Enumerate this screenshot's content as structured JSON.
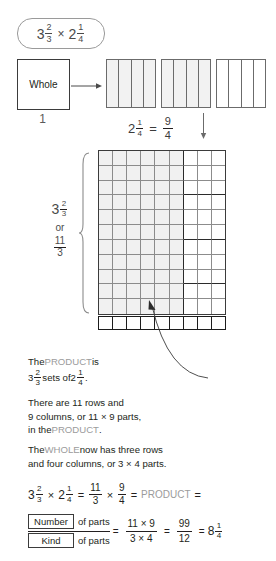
{
  "title_pill": {
    "expression": "3 2/3 x 2 1/4",
    "whole_a": "3",
    "num_a": "2",
    "den_a": "3",
    "times": "×",
    "whole_b": "2",
    "num_b": "1",
    "den_b": "4"
  },
  "whole_box": {
    "label": "Whole",
    "caption": "1"
  },
  "strip_caption": {
    "whole": "2",
    "num": "1",
    "den": "4",
    "equals": "=",
    "result_num": "9",
    "result_den": "4"
  },
  "strips": {
    "count": 3,
    "cells_per_strip": 4
  },
  "left_label": {
    "whole": "3",
    "num": "2",
    "den": "3",
    "or": "or",
    "improper_num": "11",
    "improper_den": "3"
  },
  "grid": {
    "rows": 11,
    "cols": 9,
    "shaded_cols": 6,
    "white_cols": 3,
    "thick_row_breaks": [
      3,
      6,
      9
    ],
    "bottom_strip_cells": 9
  },
  "text_product": {
    "line1_a": "The ",
    "line1_kw": "PRODUCT",
    "line1_b": " is",
    "line2_whole": "3",
    "line2_num": "2",
    "line2_den": "3",
    "line2_mid": " sets of ",
    "line2_whole2": "2",
    "line2_num2": "1",
    "line2_den2": "4",
    "line2_end": "."
  },
  "text_rows": {
    "line1": "There are 11 rows and",
    "line2": "9 columns, or 11 × 9 parts,",
    "line3_a": "in the ",
    "line3_kw": "PRODUCT",
    "line3_b": "."
  },
  "text_whole": {
    "line1_a": "The ",
    "line1_kw": "WHOLE",
    "line1_b": " now has three rows",
    "line2": "and four columns, or 3 × 4 parts."
  },
  "equation": {
    "whole_a": "3",
    "num_a": "2",
    "den_a": "3",
    "times1": "×",
    "whole_b": "2",
    "num_b": "1",
    "den_b": "4",
    "eq1": "=",
    "f1_num": "11",
    "f1_den": "3",
    "times2": "×",
    "f2_num": "9",
    "f2_den": "4",
    "eq2": "=",
    "product_kw": "PRODUCT",
    "eq3": "="
  },
  "final": {
    "number_box": "Number",
    "kind_box": "Kind",
    "of_parts_top": "of parts",
    "of_parts_bottom": "of parts",
    "eq1": "=",
    "frac1_num": "11 × 9",
    "frac1_den": "3 × 4",
    "eq2": "=",
    "frac2_num": "99",
    "frac2_den": "12",
    "eq3": "=",
    "answer_whole": "8",
    "answer_num": "1",
    "answer_den": "4"
  },
  "colors": {
    "ink": "#231f20",
    "keyword_gray": "#9b9b9b",
    "grid_shade": "#f1f1f1",
    "grid_line": "#8c8c8c",
    "thick_line": "#2b2b2b"
  }
}
